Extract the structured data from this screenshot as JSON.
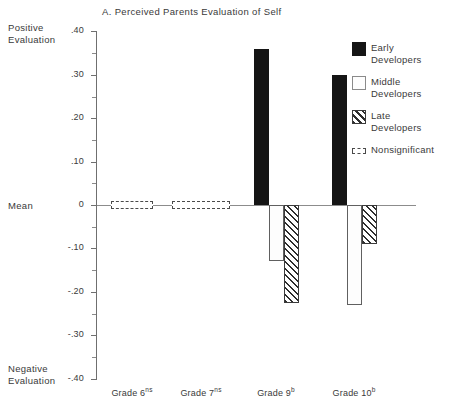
{
  "chart_data": {
    "type": "bar",
    "title": "A. Perceived Parents Evaluation of Self",
    "xlabel": "",
    "ylabel": "Mean",
    "ylim": [
      -0.4,
      0.4
    ],
    "grid": false,
    "legend_position": "right",
    "axis_captions": {
      "positive": "Positive\nEvaluation",
      "mean": "Mean",
      "negative": "Negative\nEvaluation"
    },
    "y_major_ticks": [
      {
        "value": 0.4,
        "label": ".40"
      },
      {
        "value": 0.3,
        "label": ".30"
      },
      {
        "value": 0.2,
        "label": ".20"
      },
      {
        "value": 0.1,
        "label": ".10"
      },
      {
        "value": 0.0,
        "label": "0"
      },
      {
        "value": -0.1,
        "label": "-.10"
      },
      {
        "value": -0.2,
        "label": "-.20"
      },
      {
        "value": -0.3,
        "label": "-.30"
      },
      {
        "value": -0.4,
        "label": "-.40"
      }
    ],
    "y_minor_ticks": [
      0.35,
      0.25,
      0.15,
      0.05,
      -0.05,
      -0.15,
      -0.25,
      -0.35
    ],
    "categories": [
      {
        "label": "Grade 6",
        "superscript": "ns",
        "significant": false
      },
      {
        "label": "Grade 7",
        "superscript": "ns",
        "significant": false
      },
      {
        "label": "Grade 9",
        "superscript": "b",
        "significant": true
      },
      {
        "label": "Grade 10",
        "superscript": "b",
        "significant": true
      }
    ],
    "series": [
      {
        "name": "Early Developers",
        "pattern": "solid-black",
        "color": "#151515",
        "values": [
          0.0,
          0.0,
          0.36,
          0.3
        ]
      },
      {
        "name": "Middle Developers",
        "pattern": "dotted",
        "color": "#fdfdfd",
        "values": [
          0.0,
          0.0,
          -0.13,
          -0.23
        ]
      },
      {
        "name": "Late Developers",
        "pattern": "diagonal-hatch",
        "color": "#ffffff",
        "values": [
          0.0,
          0.0,
          -0.225,
          -0.09
        ]
      }
    ],
    "nonsignificant_markers": [
      {
        "category": "Grade 6",
        "value": 0.0,
        "note": "Nonsignificant"
      },
      {
        "category": "Grade 7",
        "value": 0.0,
        "note": "Nonsignificant"
      }
    ],
    "legend": [
      {
        "label": "Early\nDevelopers",
        "swatch": "solid-black"
      },
      {
        "label": "Middle\nDevelopers",
        "swatch": "dotted"
      },
      {
        "label": "Late\nDevelopers",
        "swatch": "diagonal-hatch"
      },
      {
        "label": "Nonsignificant",
        "swatch": "dashed-outline"
      }
    ]
  }
}
